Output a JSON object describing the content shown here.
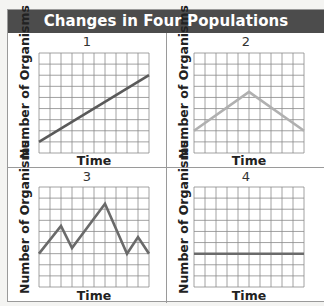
{
  "title": "Changes in Four Populations",
  "axes": {
    "xlabel": "Time",
    "ylabel": "Number of Organisms"
  },
  "panels": [
    {
      "label": "1",
      "color": "#5a5a5a"
    },
    {
      "label": "2",
      "color": "#b0b0b0"
    },
    {
      "label": "3",
      "color": "#6a6a6a"
    },
    {
      "label": "4",
      "color": "#6a6a6a"
    }
  ],
  "chart_data": [
    {
      "type": "line",
      "title": "1",
      "xlabel": "Time",
      "ylabel": "Number of Organisms",
      "grid": true,
      "grid_cols": 10,
      "grid_rows": 9,
      "xlim": [
        0,
        10
      ],
      "ylim": [
        0,
        9
      ],
      "x": [
        0,
        10
      ],
      "values": [
        1,
        7
      ],
      "trend": "steady increase"
    },
    {
      "type": "line",
      "title": "2",
      "xlabel": "Time",
      "ylabel": "Number of Organisms",
      "grid": true,
      "grid_cols": 10,
      "grid_rows": 9,
      "xlim": [
        0,
        10
      ],
      "ylim": [
        0,
        9
      ],
      "x": [
        0,
        5,
        10
      ],
      "values": [
        2,
        5.5,
        2
      ],
      "trend": "increase then decrease"
    },
    {
      "type": "line",
      "title": "3",
      "xlabel": "Time",
      "ylabel": "Number of Organisms",
      "grid": true,
      "grid_cols": 10,
      "grid_rows": 9,
      "xlim": [
        0,
        10
      ],
      "ylim": [
        0,
        9
      ],
      "x": [
        0,
        2,
        3,
        6,
        8,
        9,
        10
      ],
      "values": [
        3,
        5.5,
        3.5,
        7.5,
        3,
        4.5,
        3
      ],
      "trend": "fluctuating"
    },
    {
      "type": "line",
      "title": "4",
      "xlabel": "Time",
      "ylabel": "Number of Organisms",
      "grid": true,
      "grid_cols": 10,
      "grid_rows": 9,
      "xlim": [
        0,
        10
      ],
      "ylim": [
        0,
        9
      ],
      "x": [
        0,
        10
      ],
      "values": [
        3,
        3
      ],
      "trend": "constant"
    }
  ]
}
